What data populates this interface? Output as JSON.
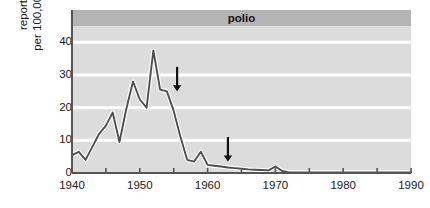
{
  "chart_data": {
    "type": "line",
    "title": "polio",
    "xlabel": "",
    "ylabel": "reported cases per 100,000 population",
    "ylabel_line1": "reported cases",
    "ylabel_line2": "per 100,000 population",
    "xlim": [
      1940,
      1990
    ],
    "ylim": [
      0,
      45
    ],
    "y_ticks": [
      0,
      10,
      20,
      30,
      40
    ],
    "y_tick_labels": [
      "0",
      "10",
      "20",
      "30",
      "40"
    ],
    "x_ticks": [
      1940,
      1945,
      1950,
      1955,
      1960,
      1965,
      1970,
      1975,
      1980,
      1985,
      1990
    ],
    "x_tick_labels": [
      "1940",
      "",
      "1950",
      "",
      "1960",
      "",
      "1970",
      "",
      "1980",
      "",
      "1990"
    ],
    "x_major_labels": [
      "1940",
      "1950",
      "1960",
      "1970",
      "1980",
      "1990"
    ],
    "x_major_values": [
      1940,
      1950,
      1960,
      1970,
      1980,
      1990
    ],
    "grid": true,
    "grid_color": "#ffffff",
    "plot_background": "#dcdcdc",
    "title_band_color": "#b4b4b4",
    "line_color": "#4d4d4d",
    "line_halo_color": "#ffffff",
    "legend": "none",
    "x": [
      1940,
      1941,
      1942,
      1943,
      1944,
      1945,
      1946,
      1947,
      1948,
      1949,
      1950,
      1951,
      1952,
      1953,
      1954,
      1955,
      1956,
      1957,
      1958,
      1959,
      1960,
      1961,
      1962,
      1963,
      1964,
      1965,
      1966,
      1967,
      1968,
      1969,
      1970,
      1971,
      1972,
      1973,
      1974,
      1975,
      1976,
      1977,
      1978,
      1979,
      1980,
      1981,
      1982,
      1983,
      1984,
      1985,
      1986,
      1987,
      1988,
      1989,
      1990
    ],
    "values": [
      5.5,
      6.5,
      4.0,
      8.0,
      12.0,
      14.5,
      18.5,
      9.5,
      19.5,
      28.0,
      22.5,
      20.0,
      37.5,
      25.5,
      25.0,
      19.0,
      11.0,
      4.0,
      3.5,
      6.5,
      2.5,
      2.2,
      2.0,
      1.7,
      1.5,
      1.3,
      1.1,
      1.0,
      0.9,
      0.8,
      2.0,
      0.6,
      0.2,
      0.2,
      0.2,
      0.2,
      0.2,
      0.2,
      0.2,
      0.2,
      0.2,
      0.2,
      0.2,
      0.2,
      0.2,
      0.2,
      0.2,
      0.2,
      0.2,
      0.2,
      0.2
    ],
    "annotations": [
      {
        "name": "inactivated-vaccine",
        "text": "inactivated vaccine",
        "x_year": 1955.5,
        "label_x_year": 1956.2,
        "arrow_top_y": 32.5,
        "arrow_bottom_y": 25.0
      },
      {
        "name": "oral-vaccine",
        "text": "oral vaccine",
        "x_year": 1963.0,
        "label_x_year": 1963.5,
        "arrow_top_y": 11.0,
        "arrow_bottom_y": 3.5
      }
    ]
  }
}
